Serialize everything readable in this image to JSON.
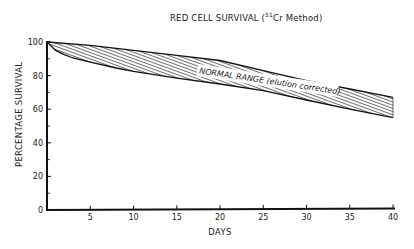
{
  "chart_data": {
    "type": "area",
    "title": "RED CELL SURVIVAL (51Cr Method)",
    "title_main": "RED CELL SURVIVAL (",
    "title_sup": "51",
    "title_tail": "Cr Method)",
    "xlabel": "DAYS",
    "ylabel": "PERCENTAGE SURVIVAL",
    "xlim": [
      0,
      40
    ],
    "ylim": [
      0,
      100
    ],
    "x_ticks": [
      5,
      10,
      15,
      20,
      25,
      30,
      35,
      40
    ],
    "y_ticks": [
      0,
      20,
      40,
      60,
      80,
      100
    ],
    "y_minor_ticks": [
      10,
      30,
      50,
      70,
      90
    ],
    "grid": false,
    "legend": null,
    "annotation": "NORMAL RANGE (elution corrected)",
    "series": [
      {
        "name": "Normal range upper bound",
        "x": [
          0,
          5,
          10,
          15,
          20,
          25,
          30,
          35,
          40
        ],
        "values": [
          100,
          98,
          95,
          92,
          89,
          83,
          77,
          72,
          67
        ]
      },
      {
        "name": "Normal range lower bound",
        "x": [
          0,
          1,
          2,
          3,
          5,
          8,
          10,
          15,
          20,
          25,
          30,
          35,
          40
        ],
        "values": [
          100,
          95,
          92.5,
          90.5,
          88,
          84.5,
          82.5,
          78.5,
          75,
          71,
          65.5,
          60,
          55
        ]
      }
    ],
    "fill_color": "#555555",
    "line_color": "#111111"
  }
}
